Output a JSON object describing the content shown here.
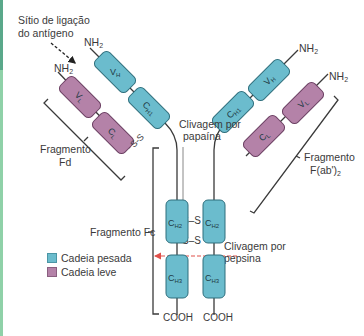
{
  "labels": {
    "antigen_site_line1": "Sítio de ligação",
    "antigen_site_line2": "do antígeno",
    "nh2": "NH",
    "nh2_sub": "2",
    "cooh": "COOH",
    "papain_line1": "Clivagem por",
    "papain_line2": "papaína",
    "pepsin_line1": "Clivagem por",
    "pepsin_line2": "pepsina",
    "fd_line1": "Fragmento",
    "fd_line2": "Fd",
    "fab2_line1": "Fragmento",
    "fab2_line2": "F(ab')",
    "fab2_sub": "2",
    "fc": "Fragmento Fc",
    "ss": "S–S",
    "ss_short": "S-S"
  },
  "domains": {
    "vh": {
      "main": "V",
      "sub": "H"
    },
    "vl": {
      "main": "V",
      "sub": "L"
    },
    "ch1": {
      "main": "C",
      "sub": "H1"
    },
    "cl": {
      "main": "C",
      "sub": "L"
    },
    "ch2": {
      "main": "C",
      "sub": "H2"
    },
    "ch3": {
      "main": "C",
      "sub": "H3"
    }
  },
  "legend": {
    "items": [
      {
        "label": "Cadeia pesada",
        "color": "#6bbccd"
      },
      {
        "label": "Cadeia leve",
        "color": "#b482a8"
      }
    ]
  },
  "colors": {
    "heavy_chain": "#6bbccd",
    "light_chain": "#b482a8",
    "pepsin_arrow": "#e0504a",
    "accent_strip": "#8fd1a8"
  }
}
